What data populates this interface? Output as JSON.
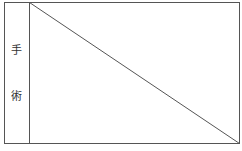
{
  "diagram": {
    "type": "labeled-rectangle-with-diagonal",
    "side_label": {
      "characters": [
        "手",
        "術"
      ],
      "text": "手術"
    },
    "frame": {
      "outer": {
        "x1": 4.5,
        "y1": 2.5,
        "x2": 239.5,
        "y2": 143.5
      },
      "divider_x": 29.5,
      "diagonal": {
        "x1": 29.5,
        "y1": 2.5,
        "x2": 239.5,
        "y2": 143.5
      }
    },
    "colors": {
      "line": "#555555",
      "text": "#333333",
      "background": "#ffffff"
    }
  }
}
